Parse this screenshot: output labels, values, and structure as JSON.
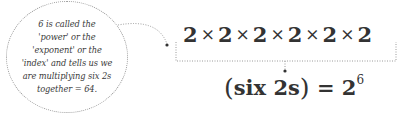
{
  "annotation": {
    "lines": [
      "6 is called the",
      "'power' or the",
      "'exponent' or the",
      "'index' and tells us we",
      "are multiplying six 2s",
      "together = 64."
    ]
  },
  "expression": {
    "factors": [
      "2",
      "2",
      "2",
      "2",
      "2",
      "2"
    ],
    "operator": "×"
  },
  "result": {
    "open_paren": "(",
    "label": "six 2s",
    "close_paren": ")",
    "equals": "=",
    "base": "2",
    "exponent": "6"
  },
  "colors": {
    "text": "#333333",
    "dotted_line": "#9a9a9a"
  }
}
